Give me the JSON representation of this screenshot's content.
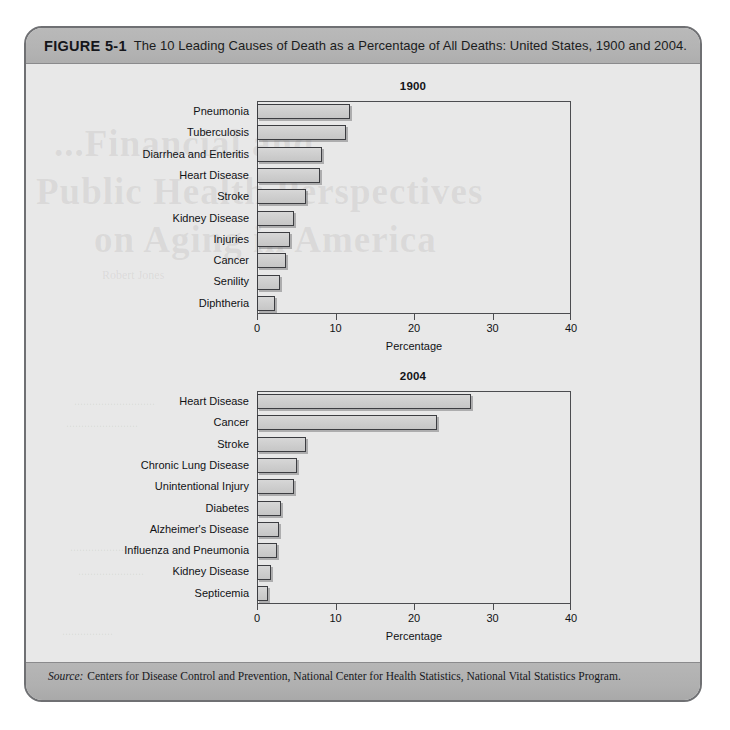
{
  "figure": {
    "number_label": "FIGURE 5-1",
    "caption": "The 10 Leading Causes of Death as a Percentage of All Deaths: United States, 1900 and 2004.",
    "source_label": "Source:",
    "source_text": "Centers for Disease Control and Prevention, National Center for Health Statistics, National Vital Statistics Program."
  },
  "colors": {
    "frame_border": "#6f7073",
    "caption_band": "#b4b4b4",
    "body_background": "#e8e8e8",
    "source_band": "#b0b0b0",
    "bar_fill": "#cfcfcf",
    "bar_outline": "#3c3d41",
    "axis_line": "#4c4d50",
    "text": "#111215"
  },
  "bleed_text": {
    "line1": "...Financial and",
    "line2": "Public Health Perspectives",
    "line3": "on Aging in America",
    "line4": "Robert Jones",
    "line5": "...........................",
    "line6": "........................",
    "line7": "....................",
    "line8": "......................",
    "line9": "................."
  },
  "chart_data": [
    {
      "type": "bar",
      "orientation": "horizontal",
      "title": "1900",
      "xlabel": "Percentage",
      "ylabel": "",
      "xlim": [
        0,
        40
      ],
      "xticks": [
        0,
        10,
        20,
        30,
        40
      ],
      "xtick_labels": [
        "0",
        "10",
        "20",
        "30",
        "40"
      ],
      "grid": false,
      "legend": "none",
      "categories": [
        "Pneumonia",
        "Tuberculosis",
        "Diarrhea and Enteritis",
        "Heart Disease",
        "Stroke",
        "Kidney Disease",
        "Injuries",
        "Cancer",
        "Senility",
        "Diphtheria"
      ],
      "values": [
        11.8,
        11.3,
        8.3,
        8.0,
        6.2,
        4.7,
        4.2,
        3.7,
        2.9,
        2.3
      ]
    },
    {
      "type": "bar",
      "orientation": "horizontal",
      "title": "2004",
      "xlabel": "Percentage",
      "ylabel": "",
      "xlim": [
        0,
        40
      ],
      "xticks": [
        0,
        10,
        20,
        30,
        40
      ],
      "xtick_labels": [
        "0",
        "10",
        "20",
        "30",
        "40"
      ],
      "grid": false,
      "legend": "none",
      "categories": [
        "Heart Disease",
        "Cancer",
        "Stroke",
        "Chronic Lung Disease",
        "Unintentional Injury",
        "Diabetes",
        "Alzheimer's Disease",
        "Influenza and Pneumonia",
        "Kidney Disease",
        "Septicemia"
      ],
      "values": [
        27.2,
        22.9,
        6.3,
        5.1,
        4.7,
        3.1,
        2.8,
        2.5,
        1.8,
        1.4
      ]
    }
  ]
}
